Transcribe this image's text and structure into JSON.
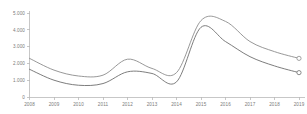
{
  "chart_data": {
    "type": "line",
    "title": "",
    "subtitle": "",
    "xlabel": "",
    "ylabel": "",
    "grid": false,
    "legend": false,
    "legend_position": "none",
    "x": [
      2008,
      2009,
      2010,
      2011,
      2012,
      2013,
      2014,
      2015,
      2016,
      2017,
      2018,
      2019
    ],
    "xtick_labels": [
      "2008",
      "2009",
      "2010",
      "2011",
      "2012",
      "2013",
      "2014",
      "2015",
      "2016",
      "2017",
      "2018",
      "2019"
    ],
    "ytick_values": [
      0,
      1000,
      2000,
      3000,
      4000,
      5000
    ],
    "ytick_labels": [
      "0",
      "1.000",
      "2.000",
      "3.000",
      "4.000",
      "5.000"
    ],
    "ylim": [
      0,
      5000
    ],
    "xlim": [
      2008,
      2019
    ],
    "series": [
      {
        "name": "upper-series",
        "color": "#8c8c8c",
        "marker_end": "open-circle",
        "values": [
          2300,
          1600,
          1250,
          1300,
          2250,
          1700,
          1450,
          4550,
          4500,
          3300,
          2700,
          2300
        ]
      },
      {
        "name": "lower-series",
        "color": "#6e6e6e",
        "marker_end": "open-circle",
        "values": [
          1650,
          1000,
          700,
          800,
          1500,
          1400,
          900,
          4150,
          3300,
          2400,
          1850,
          1450
        ]
      }
    ],
    "axis_color": "#b9b9b9",
    "label_color": "#7a7a7a"
  }
}
